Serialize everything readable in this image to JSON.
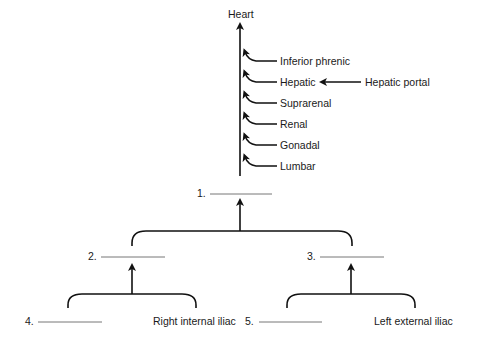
{
  "diagram": {
    "top_label": "Heart",
    "tributaries": [
      {
        "label": "Inferior phrenic"
      },
      {
        "label": "Hepatic"
      },
      {
        "label": "Suprarenal"
      },
      {
        "label": "Renal"
      },
      {
        "label": "Gonadal"
      },
      {
        "label": "Lumbar"
      }
    ],
    "hepatic_input": "Hepatic portal",
    "blanks": [
      {
        "number": "1."
      },
      {
        "number": "2."
      },
      {
        "number": "3."
      },
      {
        "number": "4."
      },
      {
        "number": "5."
      }
    ],
    "given_labels": {
      "right": "Right internal iliac",
      "left": "Left external iliac"
    },
    "colors": {
      "line": "#111111",
      "blank": "#888888"
    }
  }
}
